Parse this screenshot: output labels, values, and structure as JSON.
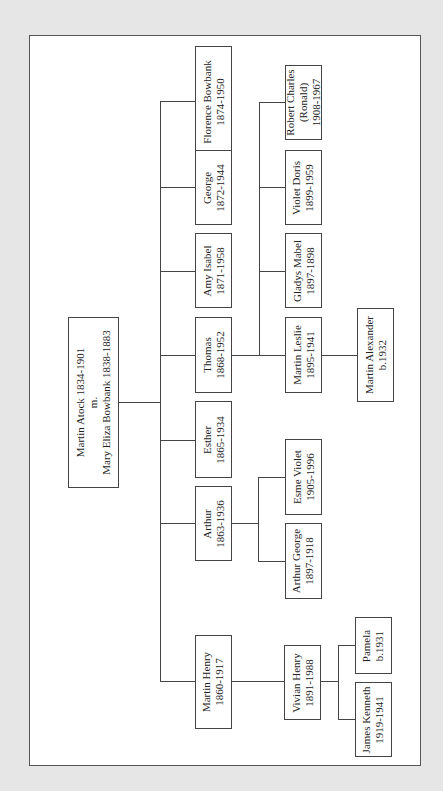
{
  "diagram": {
    "type": "family-tree",
    "orientation": "rotated-90",
    "root": {
      "id": "root",
      "lines": [
        "Martin Atock 1834-1901",
        "m.",
        "Mary Eliza Bowbank 1838-1883"
      ]
    },
    "children": [
      {
        "id": "florence",
        "lines": [
          "Florence Bowbank",
          "1874-1950"
        ]
      },
      {
        "id": "george",
        "lines": [
          "George",
          "1872-1944"
        ]
      },
      {
        "id": "amy",
        "lines": [
          "Amy Isabel",
          "1871-1958"
        ]
      },
      {
        "id": "thomas",
        "lines": [
          "Thomas",
          "1868-1952"
        ]
      },
      {
        "id": "esther",
        "lines": [
          "Esther",
          "1865-1934"
        ]
      },
      {
        "id": "arthur",
        "lines": [
          "Arthur",
          "1863-1936"
        ]
      },
      {
        "id": "martin_henry",
        "lines": [
          "Martin Henry",
          "1860-1917"
        ]
      }
    ],
    "thomas_children": [
      {
        "id": "robert",
        "lines": [
          "Robert Charles",
          "(Ronald)",
          "1908-1967"
        ]
      },
      {
        "id": "violet",
        "lines": [
          "Violet Doris",
          "1899-1959"
        ]
      },
      {
        "id": "gladys",
        "lines": [
          "Gladys Mabel",
          "1897-1898"
        ]
      },
      {
        "id": "martin_leslie",
        "lines": [
          "Martin Leslie",
          "1895-1941"
        ]
      }
    ],
    "martin_leslie_children": [
      {
        "id": "martin_alexander",
        "lines": [
          "Martin Alexander",
          "b.1932"
        ]
      }
    ],
    "arthur_children": [
      {
        "id": "esme",
        "lines": [
          "Esme Violet",
          "1905-1996"
        ]
      },
      {
        "id": "arthur_george",
        "lines": [
          "Arthur George",
          "1897-1918"
        ]
      }
    ],
    "martin_henry_children": [
      {
        "id": "vivian",
        "lines": [
          "Vivian Henry",
          "1891-1988"
        ]
      }
    ],
    "vivian_children": [
      {
        "id": "pamela",
        "lines": [
          "Pamela",
          "b.1931"
        ]
      },
      {
        "id": "james",
        "lines": [
          "James Kenneth",
          "1919-1941"
        ]
      }
    ]
  }
}
